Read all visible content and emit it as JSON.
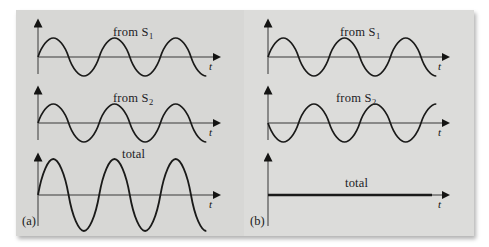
{
  "figure": {
    "kind": "wave-interference-diagram",
    "background_color": "#ffffff",
    "plate_color": "#d7d7d5",
    "curve_color": "#1a1a19",
    "axis_color": "#6e6e6c",
    "panels": [
      {
        "id": "a",
        "label": "(a)",
        "interference": "constructive",
        "plots": [
          {
            "id": "a-s1",
            "title": "from S",
            "title_sub": "1",
            "axis_label": "t",
            "wave": {
              "type": "sine",
              "amplitude": 1.0,
              "cycles": 3,
              "phase_deg": 0
            }
          },
          {
            "id": "a-s2",
            "title": "from S",
            "title_sub": "2",
            "axis_label": "t",
            "wave": {
              "type": "sine",
              "amplitude": 1.0,
              "cycles": 3,
              "phase_deg": 0
            }
          },
          {
            "id": "a-total",
            "title": "total",
            "title_sub": "",
            "axis_label": "t",
            "wave": {
              "type": "sine",
              "amplitude": 2.0,
              "cycles": 3,
              "phase_deg": 0
            }
          }
        ]
      },
      {
        "id": "b",
        "label": "(b)",
        "interference": "destructive",
        "plots": [
          {
            "id": "b-s1",
            "title": "from S",
            "title_sub": "1",
            "axis_label": "t",
            "wave": {
              "type": "sine",
              "amplitude": 1.0,
              "cycles": 3,
              "phase_deg": 0
            }
          },
          {
            "id": "b-s2",
            "title": "from S",
            "title_sub": "2",
            "axis_label": "t",
            "wave": {
              "type": "sine",
              "amplitude": 1.0,
              "cycles": 3,
              "phase_deg": 180
            }
          },
          {
            "id": "b-total",
            "title": "total",
            "title_sub": "",
            "axis_label": "t",
            "wave": {
              "type": "flat",
              "amplitude": 0.0,
              "cycles": 0,
              "phase_deg": 0
            }
          }
        ]
      }
    ]
  }
}
